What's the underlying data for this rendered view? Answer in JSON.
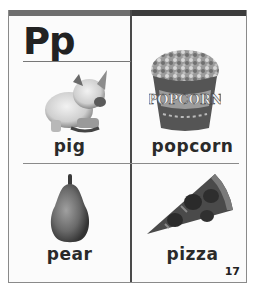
{
  "card": {
    "letter": "Pp",
    "page_number": "17",
    "colors": {
      "topbar_left": "#6e6e6e",
      "topbar_right": "#3c3c3c",
      "border": "#8a8a8a",
      "text": "#222222"
    },
    "cells": [
      {
        "word": "pig",
        "icon": "pig-icon"
      },
      {
        "word": "popcorn",
        "icon": "popcorn-icon"
      },
      {
        "word": "pear",
        "icon": "pear-icon"
      },
      {
        "word": "pizza",
        "icon": "pizza-icon"
      }
    ]
  }
}
